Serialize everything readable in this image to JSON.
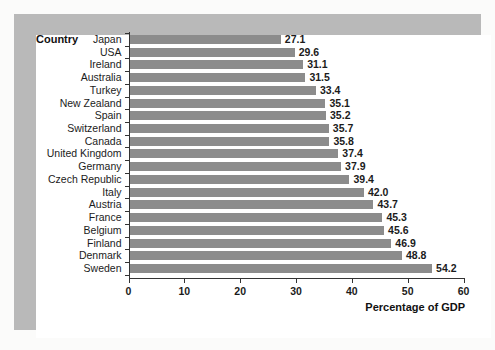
{
  "chart_data": {
    "type": "bar",
    "orientation": "horizontal",
    "title": "",
    "xlabel": "Percentage of GDP",
    "ylabel": "Country",
    "xlim": [
      0,
      60
    ],
    "xticks": [
      "0",
      "10",
      "20",
      "30",
      "40",
      "50",
      "60"
    ],
    "grid": false,
    "legend": null,
    "bar_color": "#8c8c8c",
    "categories": [
      "Japan",
      "USA",
      "Ireland",
      "Australia",
      "Turkey",
      "New Zealand",
      "Spain",
      "Switzerland",
      "Canada",
      "United Kingdom",
      "Germany",
      "Czech Republic",
      "Italy",
      "Austria",
      "France",
      "Belgium",
      "Finland",
      "Denmark",
      "Sweden"
    ],
    "values": [
      27.1,
      29.6,
      31.1,
      31.5,
      33.4,
      35.1,
      35.2,
      35.7,
      35.8,
      37.4,
      37.9,
      39.4,
      42.0,
      43.7,
      45.3,
      45.6,
      46.9,
      48.8,
      54.2
    ],
    "value_labels": [
      "27.1",
      "29.6",
      "31.1",
      "31.5",
      "33.4",
      "35.1",
      "35.2",
      "35.7",
      "35.8",
      "37.4",
      "37.9",
      "39.4",
      "42.0",
      "43.7",
      "45.3",
      "45.6",
      "46.9",
      "48.8",
      "54.2"
    ]
  }
}
